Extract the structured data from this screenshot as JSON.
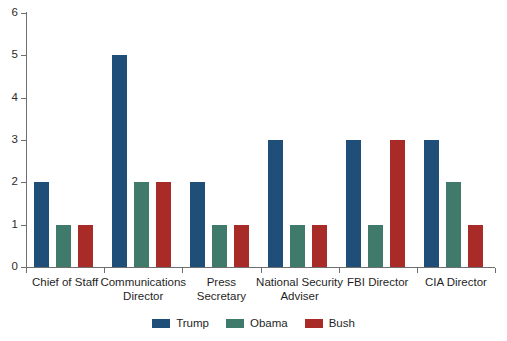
{
  "chart_data": {
    "type": "bar",
    "title": "",
    "subtitle": "",
    "xlabel": "",
    "ylabel": "",
    "ylim": [
      0,
      6
    ],
    "yticks": [
      0,
      1,
      2,
      3,
      4,
      5,
      6
    ],
    "ytick_labels": [
      "0",
      "1",
      "2",
      "3",
      "4",
      "5",
      "6"
    ],
    "grid": false,
    "legend_position": "bottom-center",
    "categories": [
      "Chief of Staff",
      "Communications\nDirector",
      "Press\nSecretary",
      "National Security\nAdviser",
      "FBI Director",
      "CIA Director"
    ],
    "series": [
      {
        "name": "Trump",
        "color": "#1f4e79",
        "values": [
          2,
          5,
          2,
          3,
          3,
          3
        ]
      },
      {
        "name": "Obama",
        "color": "#3f7a6a",
        "values": [
          1,
          2,
          1,
          1,
          1,
          2
        ]
      },
      {
        "name": "Bush",
        "color": "#a82b27",
        "values": [
          1,
          2,
          1,
          1,
          3,
          1
        ]
      }
    ]
  },
  "axis": {
    "line_color": "#6f6f6f"
  }
}
